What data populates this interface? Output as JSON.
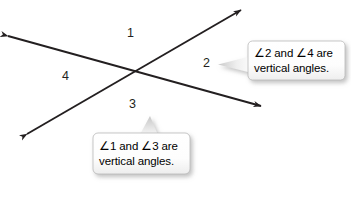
{
  "figure": {
    "background_color": "#ffffff",
    "line_color": "#231f20",
    "text_color": "#000000"
  },
  "angle_labels": [
    {
      "id": "angle-label-1",
      "text": "1",
      "x": 127,
      "y": 27
    },
    {
      "id": "angle-label-2",
      "text": "2",
      "x": 203,
      "y": 57
    },
    {
      "id": "angle-label-3",
      "text": "3",
      "x": 129,
      "y": 98
    },
    {
      "id": "angle-label-4",
      "text": "4",
      "x": 62,
      "y": 70
    }
  ],
  "lines": [
    {
      "id": "line-shallow",
      "description": "double arrow line from upper-left to lower-right",
      "x1": 8,
      "y1": 36,
      "x2": 261,
      "y2": 106
    },
    {
      "id": "line-steep",
      "description": "double arrow line from lower-left to upper-right",
      "x1": 27,
      "y1": 134,
      "x2": 241,
      "y2": 10
    }
  ],
  "intersection": {
    "x": 133,
    "y": 71
  },
  "callouts": [
    {
      "id": "callout-2-4",
      "line1_prefix": "∠2 and ",
      "line1_mid": "∠4",
      "line1_suffix": " are",
      "line1": "∠2 and ∠4 are",
      "line2": "vertical angles.",
      "tail_direction": "left",
      "box": {
        "x": 248,
        "y": 41,
        "w": 97,
        "h": 39
      }
    },
    {
      "id": "callout-1-3",
      "line1_prefix": "∠1 and ",
      "line1_mid": "∠3",
      "line1_suffix": " are",
      "line1": "∠1 and ∠3 are",
      "line2": "vertical angles.",
      "tail_direction": "up",
      "box": {
        "x": 93,
        "y": 133,
        "w": 97,
        "h": 41
      }
    }
  ]
}
